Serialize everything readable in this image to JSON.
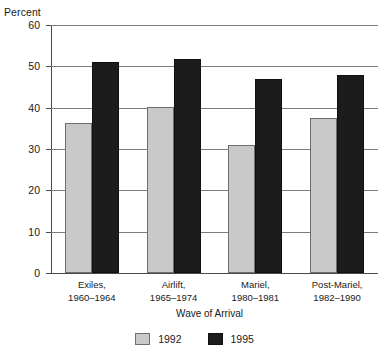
{
  "chart_data": {
    "type": "bar",
    "title": "",
    "xlabel": "Wave of Arrival",
    "ylabel": "Percent",
    "ylim": [
      0,
      60
    ],
    "yticks": [
      0,
      10,
      20,
      30,
      40,
      50,
      60
    ],
    "grid": true,
    "legend_position": "bottom-center",
    "categories": [
      "Exiles,\n1960–1964",
      "Airlift,\n1965–1974",
      "Mariel,\n1980–1981",
      "Post-Mariel,\n1982–1990"
    ],
    "category_lines": [
      [
        "Exiles,",
        "1960–1964"
      ],
      [
        "Airlift,",
        "1965–1974"
      ],
      [
        "Mariel,",
        "1980–1981"
      ],
      [
        "Post-Mariel,",
        "1982–1990"
      ]
    ],
    "series": [
      {
        "name": "1992",
        "color": "#c9c9c9",
        "values": [
          36.4,
          40.2,
          31.0,
          37.5
        ]
      },
      {
        "name": "1995",
        "color": "#1c1c1c",
        "values": [
          51.1,
          51.8,
          46.9,
          48.0
        ]
      }
    ]
  },
  "axes": {
    "y_title": "Percent",
    "x_title": "Wave of Arrival",
    "ytick_labels": [
      "0",
      "10",
      "20",
      "30",
      "40",
      "50",
      "60"
    ]
  },
  "legend": {
    "items": [
      {
        "label": "1992",
        "color": "#c9c9c9"
      },
      {
        "label": "1995",
        "color": "#1c1c1c"
      }
    ]
  }
}
